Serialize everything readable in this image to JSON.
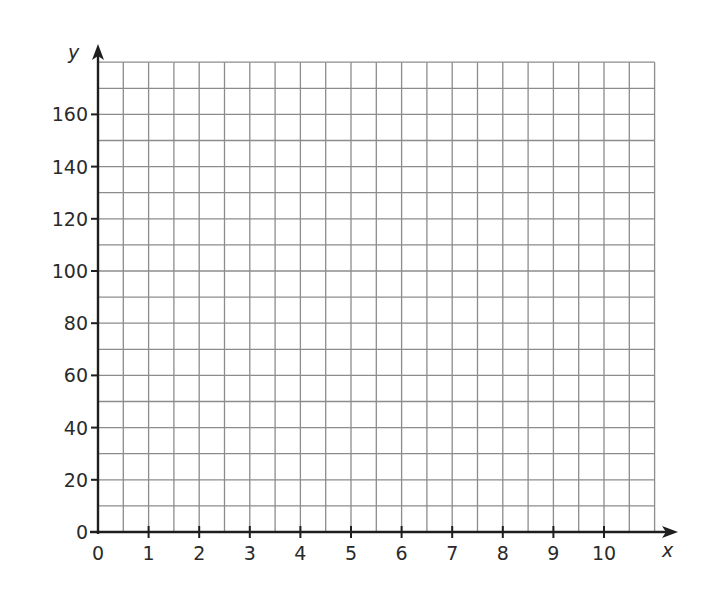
{
  "chart_data": {
    "type": "scatter",
    "title": "",
    "xlabel": "x",
    "ylabel": "y",
    "xlim": [
      0,
      11
    ],
    "ylim": [
      0,
      180
    ],
    "x_ticks": [
      0,
      1,
      2,
      3,
      4,
      5,
      6,
      7,
      8,
      9,
      10
    ],
    "y_ticks": [
      0,
      20,
      40,
      60,
      80,
      100,
      120,
      140,
      160
    ],
    "x_grid_step": 0.5,
    "y_grid_step": 10,
    "grid": true,
    "series": [],
    "note": "Blank coordinate grid with no plotted data"
  },
  "colors": {
    "axis": "#1e1e1e",
    "grid": "#8c8c8c",
    "text": "#2a2a2a",
    "background": "#ffffff"
  },
  "layout": {
    "origin_x": 98,
    "origin_y": 532,
    "px_per_x_unit": 50.6,
    "px_per_y_unit": 2.61,
    "arrow_x_end": 678,
    "arrow_y_end": 44
  }
}
